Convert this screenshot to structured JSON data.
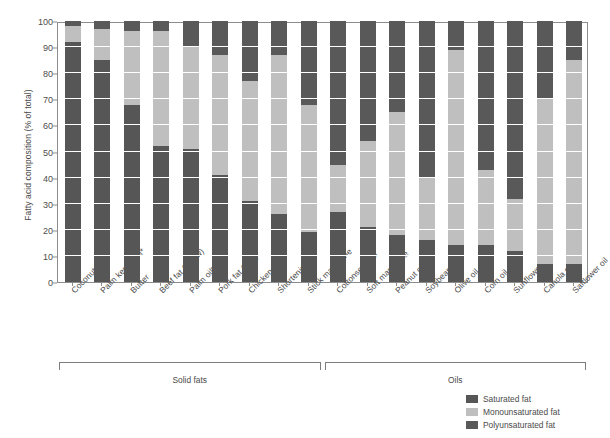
{
  "chart_data": {
    "type": "bar",
    "subtype": "stacked-vertical-100",
    "title": "",
    "xlabel": "",
    "ylabel": "Fatty acid composition (% of total)",
    "ylim": [
      0,
      100
    ],
    "ytick_labels": [
      "0",
      "10",
      "20",
      "30",
      "40",
      "50",
      "60",
      "70",
      "80",
      "90",
      "100"
    ],
    "ytick_values": [
      0,
      10,
      20,
      30,
      40,
      50,
      60,
      70,
      80,
      90,
      100
    ],
    "grid": true,
    "grid_axis": "y",
    "legend_position": "bottom-right",
    "categories": [
      "Coconut oil*",
      "Palm kernel oil*",
      "Butter",
      "Beef fat (tallow)",
      "Palm oil*",
      "Pork fat (lard)",
      "Chicken fat",
      "Shortening",
      "Stick margarine",
      "Cottonseed oil",
      "Soft margarine",
      "Peanut oil",
      "Soybean oil",
      "Olive oil",
      "Corn oil",
      "Sunflower oil",
      "Canola oil",
      "Safflower oil"
    ],
    "series": [
      {
        "name": "Saturated fat",
        "color": "#565656",
        "values": [
          92,
          85,
          68,
          52,
          51,
          41,
          31,
          26,
          19,
          27,
          21,
          18,
          16,
          14,
          14,
          12,
          7,
          7
        ]
      },
      {
        "name": "Monounsaturated fat",
        "color": "#bfbfbf",
        "values": [
          6,
          12,
          28,
          44,
          39,
          46,
          46,
          61,
          49,
          18,
          33,
          47,
          24,
          75,
          29,
          20,
          63,
          78
        ]
      },
      {
        "name": "Polyunsaturated fat",
        "color": "#595959",
        "values": [
          2,
          3,
          4,
          4,
          10,
          13,
          23,
          13,
          32,
          55,
          46,
          35,
          60,
          11,
          57,
          68,
          30,
          15
        ]
      }
    ],
    "groups": [
      {
        "label": "Solid fats",
        "start_index": 0,
        "end_index": 8
      },
      {
        "label": "Oils",
        "start_index": 9,
        "end_index": 17
      }
    ],
    "footnote_marker": "*",
    "axis_color": "#8c8c8c",
    "background_color": "#ffffff"
  }
}
